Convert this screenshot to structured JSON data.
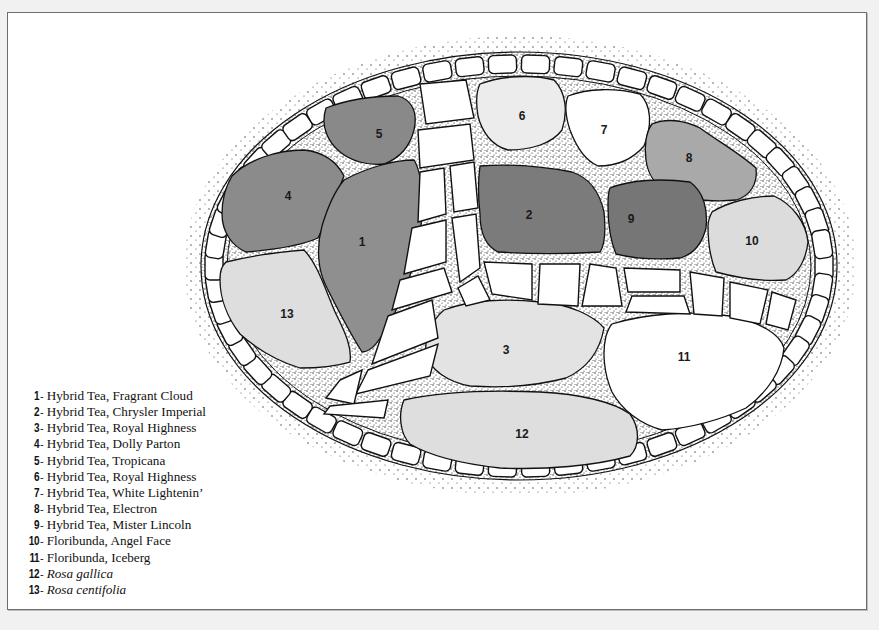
{
  "diagram": {
    "type": "rose garden planting plan",
    "colors": {
      "frame_border": "#6d6d6d",
      "page_background": "#f1f1f1",
      "paper": "#ffffff",
      "outline": "#111111",
      "gravel": "#c9c9c9",
      "stone": "#ffffff"
    },
    "beds": [
      {
        "id": "1",
        "label": "1",
        "fill": "#8f8f8f",
        "x": 362,
        "y": 246
      },
      {
        "id": "2",
        "label": "2",
        "fill": "#7b7b7b",
        "x": 529,
        "y": 219
      },
      {
        "id": "3",
        "label": "3",
        "fill": "#e3e3e3",
        "x": 506,
        "y": 354
      },
      {
        "id": "4",
        "label": "4",
        "fill": "#8b8b8b",
        "x": 288,
        "y": 200
      },
      {
        "id": "5",
        "label": "5",
        "fill": "#898989",
        "x": 379,
        "y": 138
      },
      {
        "id": "6",
        "label": "6",
        "fill": "#ececec",
        "x": 522,
        "y": 120
      },
      {
        "id": "7",
        "label": "7",
        "fill": "#ffffff",
        "x": 604,
        "y": 134
      },
      {
        "id": "8",
        "label": "8",
        "fill": "#a9a9a9",
        "x": 689,
        "y": 162
      },
      {
        "id": "9",
        "label": "9",
        "fill": "#767676",
        "x": 631,
        "y": 223
      },
      {
        "id": "10",
        "label": "10",
        "fill": "#dcdcdc",
        "x": 752,
        "y": 245
      },
      {
        "id": "11",
        "label": "11",
        "fill": "#ffffff",
        "x": 684,
        "y": 361
      },
      {
        "id": "12",
        "label": "12",
        "fill": "#dedede",
        "x": 522,
        "y": 438
      },
      {
        "id": "13",
        "label": "13",
        "fill": "#dedede",
        "x": 287,
        "y": 318
      }
    ]
  },
  "legend": {
    "items": [
      {
        "num": "1",
        "text": "Hybrid Tea, Fragrant Cloud",
        "italic": false
      },
      {
        "num": "2",
        "text": "Hybrid Tea, Chrysler Imperial",
        "italic": false
      },
      {
        "num": "3",
        "text": "Hybrid Tea, Royal Highness",
        "italic": false
      },
      {
        "num": "4",
        "text": "Hybrid Tea, Dolly Parton",
        "italic": false
      },
      {
        "num": "5",
        "text": "Hybrid Tea, Tropicana",
        "italic": false
      },
      {
        "num": "6",
        "text": "Hybrid Tea, Royal Highness",
        "italic": false
      },
      {
        "num": "7",
        "text": "Hybrid Tea, White Lightenin’",
        "italic": false
      },
      {
        "num": "8",
        "text": "Hybrid Tea, Electron",
        "italic": false
      },
      {
        "num": "9",
        "text": "Hybrid Tea, Mister Lincoln",
        "italic": false
      },
      {
        "num": "10",
        "text": "Floribunda, Angel Face",
        "italic": false
      },
      {
        "num": "11",
        "text": "Floribunda, Iceberg",
        "italic": false
      },
      {
        "num": "12",
        "text": "Rosa gallica",
        "italic": true
      },
      {
        "num": "13",
        "text": "Rosa centifolia",
        "italic": true
      }
    ],
    "dash": "-"
  }
}
